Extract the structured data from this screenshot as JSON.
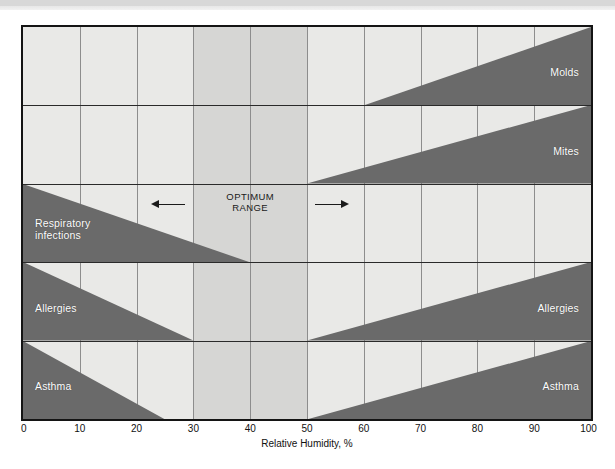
{
  "chart_data": {
    "type": "area",
    "title": "",
    "xlabel": "Relative Humidity, %",
    "ylabel": "",
    "xlim": [
      0,
      100
    ],
    "xticks": [
      0,
      10,
      20,
      30,
      40,
      50,
      60,
      70,
      80,
      90,
      100
    ],
    "xtick_labels": [
      "0",
      "10",
      "20",
      "30",
      "40",
      "50",
      "60",
      "70",
      "80",
      "90",
      "100"
    ],
    "grid": true,
    "legend": "none",
    "optimum_range": {
      "label": "OPTIMUM\nRANGE",
      "start": 30,
      "end": 50
    },
    "bands": [
      {
        "name": "Molds",
        "label": "Molds",
        "row": 0,
        "side": "right",
        "start": 60,
        "end": 100,
        "thickness_at_start": 0.0,
        "thickness_at_end": 1.0,
        "description": "Mold growth increases from about 60% relative humidity up to 100%"
      },
      {
        "name": "Mites",
        "label": "Mites",
        "row": 1,
        "side": "right",
        "start": 50,
        "end": 100,
        "thickness_at_start": 0.0,
        "thickness_at_end": 1.0,
        "description": "Dust mite activity increases from about 50% relative humidity up to 100%"
      },
      {
        "name": "Respiratory infections",
        "label": "Respiratory\ninfections",
        "row": 2,
        "side": "left",
        "start": 0,
        "end": 40,
        "thickness_at_start": 1.0,
        "thickness_at_end": 0.0,
        "description": "Respiratory infections decrease from 0% up to about 40% relative humidity"
      },
      {
        "name": "Allergies (low humidity)",
        "label": "Allergies",
        "row": 3,
        "side": "left",
        "start": 0,
        "end": 30,
        "thickness_at_start": 1.0,
        "thickness_at_end": 0.0,
        "description": "Allergic reactions decrease from 0% up to about 30% relative humidity"
      },
      {
        "name": "Allergies (high humidity)",
        "label": "Allergies",
        "row": 3,
        "side": "right",
        "start": 50,
        "end": 100,
        "thickness_at_start": 0.0,
        "thickness_at_end": 1.0,
        "description": "Allergic reactions increase from about 50% up to 100% relative humidity"
      },
      {
        "name": "Asthma (low humidity)",
        "label": "Asthma",
        "row": 4,
        "side": "left",
        "start": 0,
        "end": 25,
        "thickness_at_start": 1.0,
        "thickness_at_end": 0.0,
        "description": "Asthma decreases from 0% up to about 25% relative humidity"
      },
      {
        "name": "Asthma (high humidity)",
        "label": "Asthma",
        "row": 4,
        "side": "right",
        "start": 50,
        "end": 100,
        "thickness_at_start": 0.0,
        "thickness_at_end": 1.0,
        "description": "Asthma increases from about 50% up to 100% relative humidity"
      }
    ],
    "colors": {
      "band_fill": "#6a6a6a",
      "plot_background": "#e9e9e7",
      "optimum_shade": "#d6d6d4",
      "grid_line": "#8d8d8d",
      "frame": "#141414",
      "band_label_text": "#ffffff",
      "axis_text": "#111111"
    }
  },
  "axis": {
    "x_title": "Relative Humidity, %",
    "ticks": [
      "0",
      "10",
      "20",
      "30",
      "40",
      "50",
      "60",
      "70",
      "80",
      "90",
      "100"
    ]
  },
  "labels": {
    "molds": "Molds",
    "mites": "Mites",
    "respiratory_infections": "Respiratory\ninfections",
    "allergies_left": "Allergies",
    "allergies_right": "Allergies",
    "asthma_left": "Asthma",
    "asthma_right": "Asthma",
    "optimum_range": "OPTIMUM\nRANGE"
  }
}
